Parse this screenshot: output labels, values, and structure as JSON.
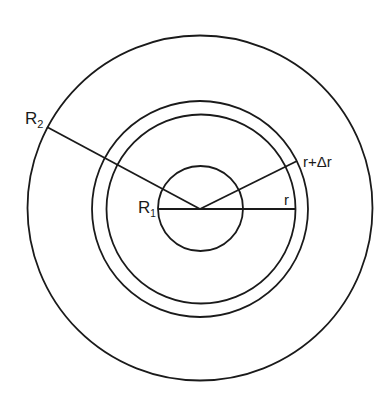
{
  "diagram": {
    "center": {
      "x": 200,
      "y": 209
    },
    "stroke_color": "#1a1a1a",
    "background": "#ffffff",
    "circles": [
      {
        "id": "outer-boundary",
        "label_ref": "R2",
        "r": 173
      },
      {
        "id": "shell-outer",
        "label_ref": "r+Δr",
        "r": 108
      },
      {
        "id": "shell-inner",
        "label_ref": "r",
        "r": 95
      },
      {
        "id": "inner-boundary",
        "label_ref": "R1",
        "r": 42
      }
    ],
    "lines": [
      {
        "id": "radius-R2",
        "x1": 47,
        "y1": 127,
        "x2": 200,
        "y2": 209
      },
      {
        "id": "radius-r-plus-dr",
        "x1": 200,
        "y1": 209,
        "x2": 297,
        "y2": 161
      },
      {
        "id": "radius-r",
        "x1": 158,
        "y1": 209,
        "x2": 295,
        "y2": 209
      }
    ],
    "labels": {
      "R2": {
        "main": "R",
        "sub": "2",
        "x": 25,
        "y": 123
      },
      "R1": {
        "main": "R",
        "sub": "1",
        "x": 139,
        "y": 214
      },
      "r_plus_dr": {
        "text": "r+Δr",
        "x": 303,
        "y": 167
      },
      "r": {
        "text": "r",
        "x": 284,
        "y": 205
      }
    }
  }
}
